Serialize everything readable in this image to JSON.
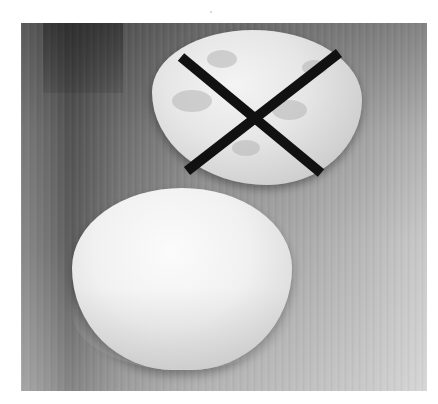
{
  "image": {
    "alt": "Two balls of pastry dough on a wooden surface; the crumbly upper ball is crossed out with a black X, the smooth lower disk is the correct result",
    "style": "grayscale photograph",
    "colors": {
      "x_mark": "#111111",
      "dough_light": "#f4f4f4",
      "wood_dark": "#5c5c5c",
      "wood_light": "#c9c9c9",
      "page_background": "#ffffff"
    },
    "subjects": [
      {
        "name": "crumbly-dough",
        "state": "incorrect",
        "marked": "X"
      },
      {
        "name": "smooth-dough-disk",
        "state": "correct",
        "marked": "none"
      }
    ]
  }
}
